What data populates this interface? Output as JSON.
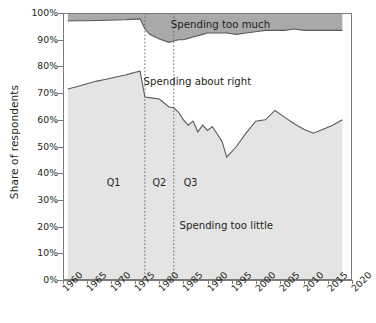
{
  "chart_data": {
    "type": "area",
    "title": "",
    "subtitle": "",
    "xlabel": "",
    "ylabel": "Share of respondents",
    "xlim": [
      1960,
      2020
    ],
    "ylim": [
      0,
      100
    ],
    "grid": false,
    "legend_position": "inline-annotations",
    "stacked": true,
    "stack_total": 100,
    "x_ticks": [
      "1960",
      "1965",
      "1970",
      "1975",
      "1980",
      "1985",
      "1990",
      "1995",
      "2000",
      "2005",
      "2010",
      "2015",
      "2020"
    ],
    "y_ticks": [
      "0%",
      "10%",
      "20%",
      "30%",
      "40%",
      "50%",
      "60%",
      "70%",
      "80%",
      "90%",
      "100%"
    ],
    "x": [
      1961,
      1963,
      1965,
      1967,
      1969,
      1971,
      1973,
      1974,
      1975,
      1976,
      1977,
      1978,
      1980,
      1982,
      1983,
      1984,
      1985,
      1986,
      1987,
      1988,
      1989,
      1990,
      1991,
      1993,
      1994,
      1996,
      1998,
      2000,
      2002,
      2004,
      2006,
      2008,
      2010,
      2012,
      2014,
      2016,
      2018
    ],
    "series": [
      {
        "name": "Spending too little",
        "color": "#e4e4e4",
        "values": [
          71.5,
          72.5,
          73.5,
          74.5,
          75.2,
          76.0,
          76.8,
          77.3,
          77.8,
          78.2,
          68.5,
          68.3,
          67.8,
          64.8,
          64.5,
          62.8,
          60.0,
          58.0,
          59.5,
          55.5,
          58.0,
          56.0,
          57.5,
          52.0,
          46.0,
          50.0,
          55.0,
          59.5,
          60.0,
          63.5,
          61.0,
          58.5,
          56.5,
          55.0,
          56.5,
          58.0,
          60.0
        ]
      },
      {
        "name": "Spending about right",
        "color": "#ffffff",
        "values": [
          25.5,
          24.6,
          23.6,
          22.7,
          22.1,
          21.4,
          20.7,
          20.3,
          19.9,
          19.6,
          25.5,
          23.7,
          22.5,
          24.2,
          25.0,
          27.2,
          30.0,
          32.5,
          31.5,
          36.0,
          34.0,
          36.5,
          35.0,
          40.5,
          46.5,
          42.0,
          37.5,
          33.5,
          33.5,
          30.0,
          32.5,
          35.5,
          37.0,
          38.5,
          37.0,
          35.5,
          33.5
        ]
      },
      {
        "name": "Spending too much",
        "color": "#a9a9a9",
        "values": [
          3.0,
          2.9,
          2.9,
          2.8,
          2.7,
          2.6,
          2.5,
          2.4,
          2.3,
          2.2,
          6.0,
          8.0,
          9.7,
          11.0,
          10.5,
          10.0,
          10.0,
          9.5,
          9.0,
          8.5,
          8.0,
          7.5,
          7.5,
          7.5,
          7.5,
          8.0,
          7.5,
          7.0,
          6.5,
          6.5,
          6.5,
          6.0,
          6.5,
          6.5,
          6.5,
          6.5,
          6.5
        ]
      }
    ],
    "upper_boundary_note": "cumulative top of 'Spending about right' band",
    "annotations": [
      {
        "name": "Spending too much",
        "text": "Spending too much",
        "x_frac": 0.545,
        "y_frac": 0.022
      },
      {
        "name": "Spending about right",
        "text": "Spending about right",
        "x_frac": 0.465,
        "y_frac": 0.235
      },
      {
        "name": "Spending too little",
        "text": "Spending too little",
        "x_frac": 0.565,
        "y_frac": 0.775
      }
    ],
    "period_markers": [
      {
        "label": "Q1",
        "x": 1970.5,
        "year_range_start": 1960,
        "year_range_end": 1977
      },
      {
        "label": "Q2",
        "x": 1980.0,
        "year_range_start": 1977,
        "year_range_end": 1983
      },
      {
        "label": "Q3",
        "x": 1986.5,
        "year_range_start": 1983,
        "year_range_end": 2020
      }
    ],
    "divider_lines": [
      1977,
      1983
    ],
    "colors": {
      "too_little": "#e4e4e4",
      "about_right": "#ffffff",
      "too_much": "#a9a9a9",
      "axis": "#7b7b7b",
      "line": "#595959",
      "divider": "#6e6e6e",
      "text": "#231f20"
    }
  }
}
